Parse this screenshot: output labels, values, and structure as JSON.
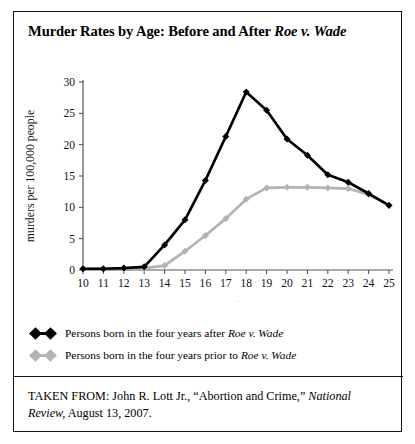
{
  "figure": {
    "title_prefix": "Murder Rates by Age: Before and After ",
    "title_italic": "Roe v. Wade"
  },
  "chart_data": {
    "type": "line",
    "title": "Murder Rates by Age: Before and After Roe v. Wade",
    "xlabel": "age",
    "ylabel": "murders per 100,000 people",
    "x": [
      10,
      11,
      12,
      13,
      14,
      15,
      16,
      17,
      18,
      19,
      20,
      21,
      22,
      23,
      24,
      25
    ],
    "xlim": [
      10,
      25
    ],
    "ylim": [
      0,
      30
    ],
    "yticks": [
      0,
      5,
      10,
      15,
      20,
      25,
      30
    ],
    "xticks": [
      10,
      11,
      12,
      13,
      14,
      15,
      16,
      17,
      18,
      19,
      20,
      21,
      22,
      23,
      24,
      25
    ],
    "grid": false,
    "legend_position": "below-plot",
    "series": [
      {
        "name": "Persons born in the four years after Roe v. Wade",
        "color": "#000000",
        "values": [
          0.2,
          0.2,
          0.3,
          0.5,
          4.0,
          8.0,
          14.3,
          21.3,
          28.4,
          25.5,
          20.9,
          18.3,
          15.2,
          14.0,
          12.2,
          10.3
        ]
      },
      {
        "name": "Persons born in the four years prior to Roe v. Wade",
        "color": "#b3b3b3",
        "values": [
          0.2,
          0.2,
          0.2,
          0.3,
          0.7,
          3.0,
          5.5,
          8.2,
          11.3,
          13.1,
          13.2,
          13.2,
          13.1,
          13.0,
          12.0,
          10.4
        ]
      }
    ]
  },
  "legend": {
    "items": [
      {
        "prefix": "Persons born in the four years after ",
        "italic": "Roe v. Wade",
        "color": "#000000"
      },
      {
        "prefix": "Persons born in the four years prior to ",
        "italic": "Roe v. Wade",
        "color": "#b3b3b3"
      }
    ]
  },
  "source": {
    "lead": "TAKEN FROM: John R. Lott Jr., “Abortion and Crime,” ",
    "publication": "National Review,",
    "tail": " August 13, 2007."
  }
}
